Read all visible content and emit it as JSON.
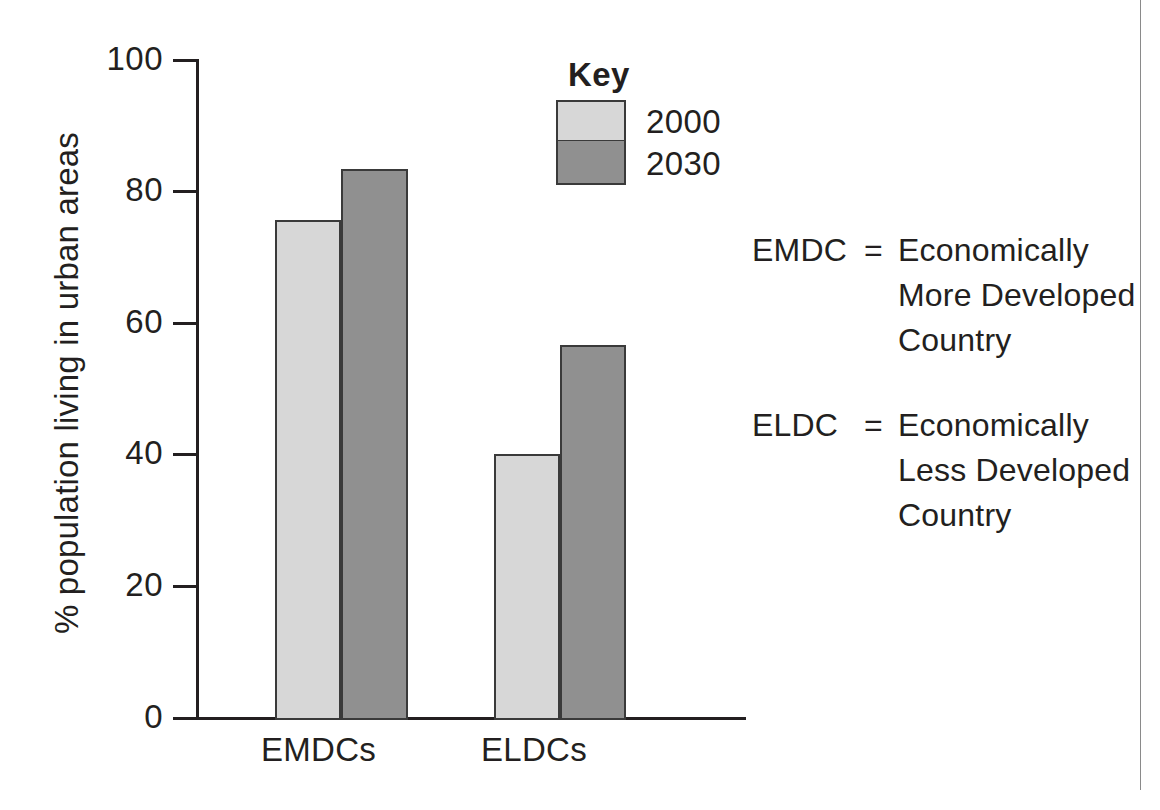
{
  "chart_data": {
    "type": "bar",
    "title": "",
    "xlabel": "",
    "ylabel": "% population living in urban areas",
    "ylim": [
      0,
      100
    ],
    "yticks": [
      "0",
      "20",
      "40",
      "60",
      "80",
      "100"
    ],
    "grid": false,
    "legend_position": "top-right-inside",
    "legend_title": "Key",
    "categories": [
      "EMDCs",
      "ELDCs"
    ],
    "series": [
      {
        "name": "2000",
        "color": "#d7d7d7",
        "values": [
          75.6,
          40.2
        ]
      },
      {
        "name": "2030",
        "color": "#909090",
        "values": [
          83.4,
          56.7
        ]
      }
    ],
    "annotations": [
      "EMDC = Economically More Developed Country",
      "ELDC = Economically Less Developed Country"
    ]
  },
  "axis": {
    "y_title": "% population living in urban areas",
    "ticks": [
      {
        "label": "100",
        "value": 100
      },
      {
        "label": "80",
        "value": 80
      },
      {
        "label": "60",
        "value": 60
      },
      {
        "label": "40",
        "value": 40
      },
      {
        "label": "20",
        "value": 20
      },
      {
        "label": "0",
        "value": 0
      }
    ],
    "categories": [
      {
        "label": "EMDCs"
      },
      {
        "label": "ELDCs"
      }
    ]
  },
  "key": {
    "title": "Key",
    "entries": [
      {
        "label": "2000",
        "color": "#d7d7d7"
      },
      {
        "label": "2030",
        "color": "#909090"
      }
    ]
  },
  "definitions": [
    {
      "abbr": "EMDC",
      "eq": "=",
      "line1": "Economically",
      "line2": "More Developed",
      "line3": "Country"
    },
    {
      "abbr": "ELDC",
      "eq": "=",
      "line1": "Economically",
      "line2": "Less Developed",
      "line3": "Country"
    }
  ],
  "colors": {
    "series_2000": "#d7d7d7",
    "series_2030": "#909090",
    "ink": "#231f20",
    "bar_outline": "#3a3a3a",
    "background": "#ffffff"
  }
}
